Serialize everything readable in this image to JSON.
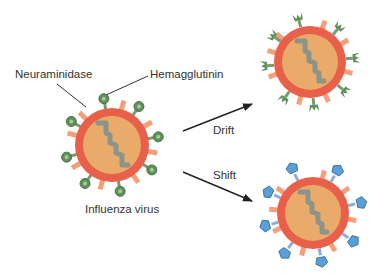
{
  "diagram": {
    "labels": {
      "neuraminidase": "Neuraminidase",
      "hemagglutinin": "Hemagglutinin",
      "influenza_virus": "Influenza virus",
      "drift": "Drift",
      "shift": "Shift"
    },
    "colors": {
      "envelope": "#e8604a",
      "core": "#eaaa6a",
      "rna": "#8a948a",
      "neuraminidase_spike": "#f3a07a",
      "hemagglutinin_original": "#5f8f5a",
      "hemagglutinin_drift": "#5f8f5a",
      "hemagglutinin_shift": "#5a9fd8",
      "arrow": "#222222",
      "leader_line": "#333333"
    },
    "nodes": [
      {
        "id": "original",
        "label": "Influenza virus",
        "spike_type": "round-green"
      },
      {
        "id": "drift",
        "label": "Drift",
        "spike_type": "tulip-green"
      },
      {
        "id": "shift",
        "label": "Shift",
        "spike_type": "pentagon-blue"
      }
    ],
    "edges": [
      {
        "from": "original",
        "to": "drift",
        "label": "Drift"
      },
      {
        "from": "original",
        "to": "shift",
        "label": "Shift"
      }
    ]
  }
}
